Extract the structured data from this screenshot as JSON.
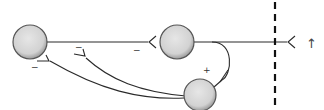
{
  "diagram": {
    "type": "neural-circuit",
    "nodes": [
      {
        "id": "A",
        "label": ""
      },
      {
        "id": "B",
        "label": ""
      },
      {
        "id": "C",
        "label": ""
      }
    ],
    "connections": [
      {
        "from": "A",
        "to": "B",
        "sign": "−",
        "type": "inhibitory"
      },
      {
        "from": "C",
        "to": "A",
        "sign": "−",
        "type": "inhibitory"
      },
      {
        "from": "C",
        "to": "A-axon",
        "sign": "−",
        "type": "inhibitory"
      },
      {
        "from": "B",
        "to": "C",
        "sign": "+",
        "type": "excitatory"
      },
      {
        "from": "B",
        "to": "output",
        "sign": "",
        "type": "output"
      }
    ],
    "signs": {
      "a_to_b": "−",
      "c_to_a": "−",
      "c_to_axon": "−",
      "b_to_c": "+"
    },
    "direction_arrow": "↑",
    "colors": {
      "node_fill": "#d6d6d6",
      "node_stroke": "#555555",
      "line": "#2a2a2a"
    }
  }
}
